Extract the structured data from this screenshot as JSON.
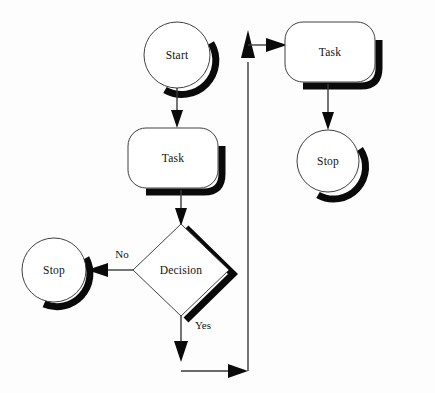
{
  "diagram": {
    "type": "flowchart",
    "background_color": "#fdfdfd",
    "line_color": "#3a3a3a",
    "shadow_color": "#0a0a0a",
    "text_color": "#111111"
  },
  "nodes": {
    "start": {
      "label": "Start",
      "shape": "circle",
      "cx": 177,
      "cy": 55,
      "r": 33
    },
    "task_main": {
      "label": "Task",
      "shape": "rounded-rect",
      "x": 128,
      "y": 128,
      "w": 90,
      "h": 60
    },
    "decision": {
      "label": "Decision",
      "shape": "diamond",
      "cx": 181,
      "cy": 270,
      "rx": 48,
      "ry": 46
    },
    "stop_left": {
      "label": "Stop",
      "shape": "circle",
      "cx": 54,
      "cy": 270,
      "r": 32
    },
    "task_right": {
      "label": "Task",
      "shape": "rounded-rect",
      "x": 285,
      "y": 22,
      "w": 90,
      "h": 60
    },
    "stop_right": {
      "label": "Stop",
      "shape": "circle",
      "cx": 328,
      "cy": 161,
      "r": 31
    }
  },
  "edges": {
    "start_to_task": {
      "label": ""
    },
    "task_to_decision": {
      "label": ""
    },
    "decision_to_stop_left": {
      "label": "No"
    },
    "decision_to_loop": {
      "label": "Yes"
    },
    "loop_to_task_right": {
      "label": ""
    },
    "task_right_to_stop_right": {
      "label": ""
    }
  }
}
